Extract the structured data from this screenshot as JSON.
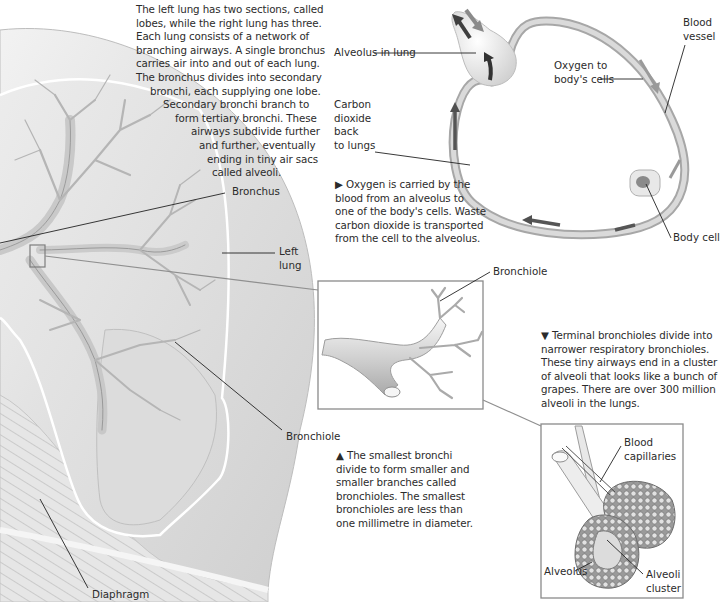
{
  "intro_text": {
    "lines": [
      "The left lung has two sections, called",
      "lobes, while the right lung has three.",
      "Each lung consists of a network of",
      "branching airways. A single bronchus",
      "carries air into and out of each lung.",
      "The bronchus divides into secondary",
      "bronchi, each supplying one lobe.",
      "Secondary bronchi branch to",
      "form tertiary bronchi. These",
      "airways subdivide further",
      "and further, eventually",
      "ending in tiny air sacs",
      "called alveoli."
    ]
  },
  "lung_labels": {
    "bronchus": "Bronchus",
    "left_lung_1": "Left",
    "left_lung_2": "lung",
    "bronchiole": "Bronchiole",
    "diaphragm": "Diaphragm"
  },
  "circulation": {
    "alveolus_in_lung": "Alveolus in lung",
    "blood_vessel_1": "Blood",
    "blood_vessel_2": "vessel",
    "oxygen_1": "Oxygen to",
    "oxygen_2": "body's cells",
    "co2_lines": [
      "Carbon",
      "dioxide",
      "back",
      "to lungs"
    ],
    "body_cell": "Body cell",
    "caption_lines": [
      "▶ Oxygen is carried by the",
      "blood from an alveolus to",
      "one of the body's cells. Waste",
      "carbon dioxide is transported",
      "from the cell to the alveolus."
    ]
  },
  "bronchiole_inset": {
    "label": "Bronchiole",
    "caption_lines": [
      "▲ The smallest bronchi",
      "divide to form smaller and",
      "smaller branches called",
      "bronchioles. The smallest",
      "bronchioles are less than",
      "one millimetre in diameter."
    ]
  },
  "alveoli_inset": {
    "caption_lines": [
      "▼ Terminal bronchioles divide into",
      "narrower respiratory bronchioles.",
      "These tiny airways end in a cluster",
      "of alveoli that looks like a bunch of",
      "grapes. There are over 300 million",
      "alveoli in the lungs."
    ],
    "blood_capillaries_1": "Blood",
    "blood_capillaries_2": "capillaries",
    "alveolus": "Alveolus",
    "alveoli_cluster_1": "Alveoli",
    "alveoli_cluster_2": "cluster"
  },
  "colors": {
    "leader_line": "#222222",
    "inset_frame": "#8a8a8a",
    "lung_fill": "#e4e4e4",
    "vessel": "#b9b9b9",
    "arrow_dark": "#4a4a4a"
  }
}
